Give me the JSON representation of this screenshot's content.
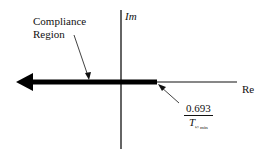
{
  "diagram": {
    "type": "complex-plane",
    "axes": {
      "imaginary_label": "Im",
      "real_label": "Re"
    },
    "annotations": {
      "region_label_line1": "Compliance",
      "region_label_line2": "Region",
      "boundary_numerator": "0.693",
      "boundary_denominator": "T",
      "boundary_subscript": "½ min"
    },
    "colors": {
      "line": "#111111",
      "background": "#ffffff"
    }
  }
}
